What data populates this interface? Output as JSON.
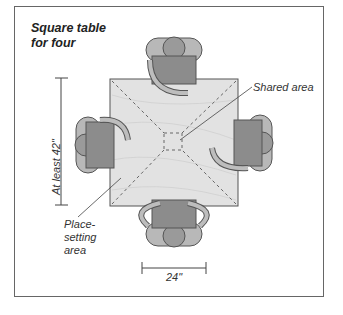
{
  "title_line1": "Square table",
  "title_line2": "for four",
  "labels": {
    "shared_area": "Shared area",
    "place_line1": "Place-",
    "place_line2": "setting",
    "place_line3": "area",
    "height_dim": "At least 42\"",
    "width_dim": "24\""
  },
  "colors": {
    "table": "#e4e4e4",
    "figure_dark": "#8a8a8a",
    "figure_mid": "#a8a8a8",
    "figure_light": "#c2c2c2",
    "dashed": "#666666"
  }
}
